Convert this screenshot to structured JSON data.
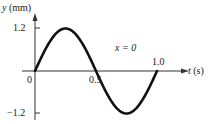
{
  "chart_data": {
    "type": "line",
    "title": "",
    "annotation": "x = 0",
    "xlabel": "t (s)",
    "ylabel": "y (mm)",
    "xlim": [
      0,
      1.0
    ],
    "ylim": [
      -1.2,
      1.2
    ],
    "grid": false,
    "legend": null,
    "x_ticks": [
      "0",
      "0.5",
      "1.0"
    ],
    "y_ticks": [
      "1.2",
      "-1.2"
    ],
    "series": [
      {
        "name": "y(t) at x = 0",
        "function": "y = 1.2 sin(2πt)",
        "amplitude": 1.2,
        "period": 1.0,
        "x": [
          0,
          0.125,
          0.25,
          0.375,
          0.5,
          0.625,
          0.75,
          0.875,
          1.0
        ],
        "values": [
          0,
          0.85,
          1.2,
          0.85,
          0,
          -0.85,
          -1.2,
          -0.85,
          0
        ]
      }
    ],
    "color": "#111111"
  },
  "labels": {
    "y_axis_var": "y",
    "y_axis_unit": "(mm)",
    "x_axis_var": "t",
    "x_axis_unit": "(s)",
    "y_top": "1.2",
    "y_bottom": "−1.2",
    "origin": "0",
    "x_mid": "0.5",
    "x_end": "1.0",
    "annotation": "x = 0"
  }
}
